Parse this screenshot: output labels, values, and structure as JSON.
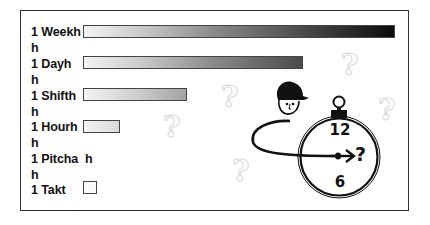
{
  "diagram": {
    "rows": [
      {
        "label": "1 Weekh",
        "bar_width": 312
      },
      {
        "label": "h",
        "bar_width": null
      },
      {
        "label": "1 Dayh",
        "bar_width": 220
      },
      {
        "label": "h",
        "bar_width": null
      },
      {
        "label": "1 Shifth",
        "bar_width": 104
      },
      {
        "label": "h",
        "bar_width": null
      },
      {
        "label": "1 Hourh",
        "bar_width": 37
      },
      {
        "label": "h",
        "bar_width": null
      },
      {
        "label": "1 Pitcha  h",
        "bar_width": null
      },
      {
        "label": "h",
        "bar_width": null
      },
      {
        "label": "1 Takt",
        "bar_width": 14
      }
    ],
    "clock": {
      "top_number": "12",
      "bottom_number": "6",
      "hand_label": "?"
    },
    "background_marks": [
      "?",
      "?",
      "?",
      "?",
      "?"
    ],
    "icons": [
      "person-with-cap-icon",
      "stopwatch-icon",
      "loop-arrow-icon",
      "question-mark-icon"
    ],
    "colors": {
      "frame": "#333333",
      "bar_light": "#f4f4f4",
      "bar_dark": "#0a0a0a",
      "faint_mark": "#d8d8d8"
    }
  }
}
